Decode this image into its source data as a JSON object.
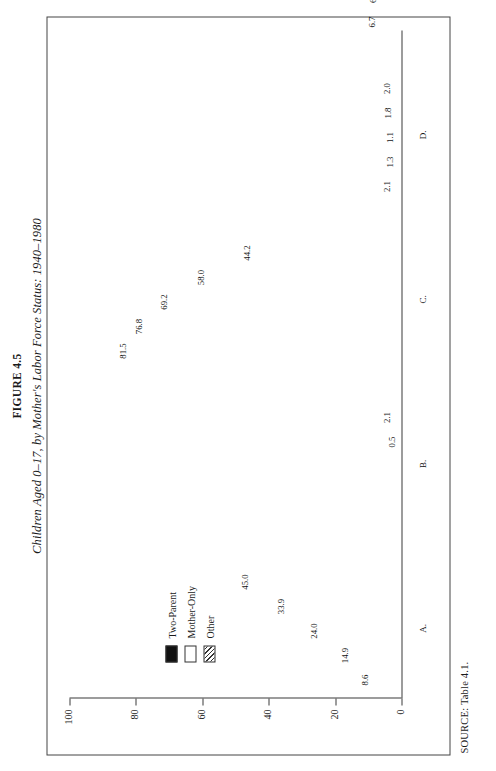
{
  "figure": {
    "number_label": "FIGURE 4.5",
    "title": "Children Aged 0–17, by Mother's Labor Force Status: 1940–1980",
    "source": "SOURCE: Table 4.1."
  },
  "legend": {
    "items": [
      {
        "label": "Two-Parent",
        "swatch": "solid-black",
        "color": "#111111"
      },
      {
        "label": "Mother-Only",
        "swatch": "solid-white",
        "color": "#ffffff"
      },
      {
        "label": "Other",
        "swatch": "hatched",
        "color": "#ffffff"
      }
    ]
  },
  "axis": {
    "y_ticks": [
      "0",
      "20",
      "40",
      "60",
      "80",
      "100"
    ],
    "y_min": 0,
    "y_max": 100
  },
  "chart_data": {
    "type": "bar",
    "subtype": "stacked-grouped",
    "title": "Children Aged 0–17, by Mother's Labor Force Status: 1940–1980",
    "xlabel": "",
    "ylabel": "",
    "ylim": [
      0,
      100
    ],
    "grid": false,
    "legend_position": "inside-left",
    "x": [
      "1940",
      "1950",
      "1960",
      "1970",
      "1980"
    ],
    "series": [
      {
        "name": "Two-Parent",
        "color": "#111111"
      },
      {
        "name": "Mother-Only",
        "color": "#ffffff"
      },
      {
        "name": "Other",
        "color": "#ffffff",
        "pattern": "hatched"
      }
    ],
    "groups": [
      {
        "key": "A",
        "label": "A.",
        "bars": [
          {
            "year": "1940",
            "total": "8.6",
            "segments": [
              {
                "series": "Two-Parent",
                "value": "6.3"
              },
              {
                "series": "Mother-Only",
                "value": "2.3"
              }
            ]
          },
          {
            "year": "1950",
            "total": "14.9",
            "segments": [
              {
                "series": "Two-Parent",
                "value": "12.0"
              },
              {
                "series": "Mother-Only",
                "value": "2.9"
              }
            ]
          },
          {
            "year": "1960",
            "total": "24.0",
            "segments": [
              {
                "series": "Two-Parent",
                "value": "20.3"
              },
              {
                "series": "Mother-Only",
                "value": "3.7"
              }
            ]
          },
          {
            "year": "1970",
            "total": "33.9",
            "segments": [
              {
                "series": "Two-Parent",
                "value": "27.8"
              },
              {
                "series": "Mother-Only",
                "value": "6.1"
              }
            ]
          },
          {
            "year": "1980",
            "total": "45.0",
            "segments": [
              {
                "series": "Two-Parent",
                "value": "36.0"
              },
              {
                "series": "Mother-Only",
                "value": "9.0"
              }
            ]
          }
        ]
      },
      {
        "key": "B",
        "label": "B.",
        "bars": [
          {
            "year": "1940",
            "total": "",
            "segments": []
          },
          {
            "year": "1950",
            "total": "",
            "segments": []
          },
          {
            "year": "1960",
            "total": "",
            "segments": []
          },
          {
            "year": "1970",
            "total": "0.5",
            "segments": [
              {
                "series": "Mother-Only",
                "value": "0.5"
              }
            ]
          },
          {
            "year": "1980",
            "total": "2.1",
            "segments": [
              {
                "series": "Mother-Only",
                "value": "2.1"
              }
            ]
          }
        ]
      },
      {
        "key": "C",
        "label": "C.",
        "bars": [
          {
            "year": "1940",
            "total": "81.5",
            "segments": [
              {
                "series": "Two-Parent",
                "value": "77.7"
              },
              {
                "series": "Mother-Only",
                "value": "3.8"
              }
            ]
          },
          {
            "year": "1950",
            "total": "76.8",
            "segments": [
              {
                "series": "Two-Parent",
                "value": "73.3"
              },
              {
                "series": "Mother-Only",
                "value": "3.5"
              }
            ]
          },
          {
            "year": "1960",
            "total": "69.2",
            "segments": [
              {
                "series": "Two-Parent",
                "value": "65.6"
              },
              {
                "series": "Mother-Only",
                "value": "3.6"
              }
            ]
          },
          {
            "year": "1970",
            "total": "58.0",
            "segments": [
              {
                "series": "Two-Parent",
                "value": "52.9"
              },
              {
                "series": "Mother-Only",
                "value": "5.1"
              }
            ]
          },
          {
            "year": "1980",
            "total": "44.2",
            "segments": [
              {
                "series": "Two-Parent",
                "value": "38.2"
              },
              {
                "series": "Mother-Only",
                "value": "6.0"
              }
            ]
          }
        ]
      },
      {
        "key": "D",
        "label": "D.",
        "bars": [
          {
            "year": "1940",
            "total": "2.1",
            "segments": [
              {
                "series": "Other",
                "value": "2.1"
              }
            ]
          },
          {
            "year": "1950",
            "total": "1.3",
            "segments": [
              {
                "series": "Other",
                "value": "1.3"
              }
            ]
          },
          {
            "year": "1960",
            "total": "1.1",
            "segments": [
              {
                "series": "Other",
                "value": "1.1"
              }
            ]
          },
          {
            "year": "1970",
            "total": "1.8",
            "segments": [
              {
                "series": "Other",
                "value": "1.8"
              }
            ]
          },
          {
            "year": "1980",
            "total": "2.0",
            "segments": [
              {
                "series": "Other",
                "value": "2.0"
              }
            ]
          }
        ]
      },
      {
        "key": "E",
        "label": "E.",
        "bars": [
          {
            "year": "1940",
            "total": "6.7",
            "segments": [
              {
                "series": "Other",
                "value": "6.7"
              }
            ]
          },
          {
            "year": "1950",
            "total": "6.2",
            "segments": [
              {
                "series": "Other",
                "value": "6.2"
              }
            ]
          },
          {
            "year": "1960",
            "total": "3.9",
            "segments": [
              {
                "series": "Other",
                "value": "3.9"
              }
            ]
          },
          {
            "year": "1970",
            "total": "4.0",
            "segments": [
              {
                "series": "Other",
                "value": "4.0"
              }
            ]
          },
          {
            "year": "1980",
            "total": "5.1",
            "segments": [
              {
                "series": "Other",
                "value": "5.1"
              }
            ]
          }
        ]
      }
    ]
  }
}
